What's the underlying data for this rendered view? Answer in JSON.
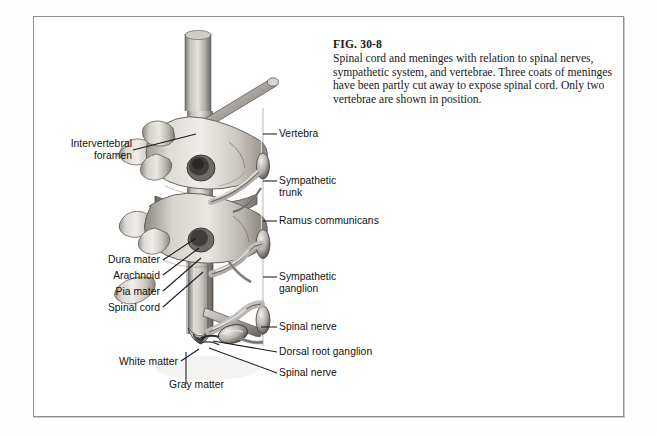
{
  "figure": {
    "number": "FIG. 30-8",
    "caption": "Spinal cord and meninges with relation to spinal nerves, sympathetic system, and vertebrae. Three coats of meninges have been partly cut away to expose spinal cord. Only two vertebrae are shown in position.",
    "style": "grayscale anatomical pen-and-ink illustration"
  },
  "labels": {
    "intervertebral_foramen": "Intervertebral\nforamen",
    "dura_mater": "Dura mater",
    "arachnoid": "Arachnoid",
    "pia_mater": "Pia mater",
    "spinal_cord": "Spinal cord",
    "white_matter": "White matter",
    "gray_matter": "Gray matter",
    "vertebra": "Vertebra",
    "sympathetic_trunk": "Sympathetic\ntrunk",
    "ramus_communicans": "Ramus communicans",
    "sympathetic_ganglion": "Sympathetic\nganglion",
    "spinal_nerve_upper": "Spinal nerve",
    "dorsal_root_ganglion": "Dorsal root ganglion",
    "spinal_nerve_lower": "Spinal nerve"
  },
  "colors": {
    "frame": "#8f8f8f",
    "page_background": "#ffffff",
    "text": "#111111",
    "caption_text": "#191919",
    "leader_line": "#1a1a1a",
    "bone_light": "#e8e6e2",
    "bone_mid": "#bdb9b3",
    "bone_dark": "#8a857f",
    "cord_light": "#d8d6d2",
    "cord_dark": "#6e6a66",
    "shadow": "#4a4744"
  }
}
